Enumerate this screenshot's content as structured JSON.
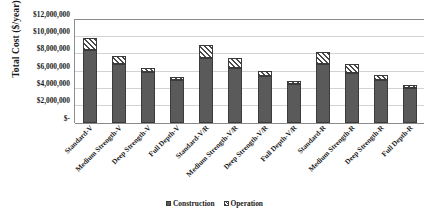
{
  "chart_data": {
    "type": "bar",
    "title": "",
    "subtitle": "",
    "xlabel": "",
    "ylabel": "Total Cost ($/year)",
    "ylim": [
      0,
      12000000
    ],
    "ytick_values": [
      12000000,
      10000000,
      8000000,
      6000000,
      4000000,
      2000000,
      0
    ],
    "ytick_labels": [
      "$12,000,000",
      "$10,000,000",
      "$8,000,000",
      "$6,000,000",
      "$4,000,000",
      "$2,000,000",
      "$-"
    ],
    "grid": true,
    "grid_axis": "y",
    "stacked": true,
    "legend_position": "bottom",
    "categories": [
      "Standard-V",
      "Medium Strength-V",
      "Deep Strength-V",
      "Full Depth-V",
      "Standard-V/R",
      "Medium Strength-V/R",
      "Deep Strength-V/R",
      "Full Depth-V/R",
      "Standard-R",
      "Medium Strength-R",
      "Deep Strength-R",
      "Full Depth-R"
    ],
    "series": [
      {
        "name": "Construction",
        "color": "#5a5a5a",
        "pattern": "solid",
        "values": [
          8400000,
          6800000,
          5800000,
          4900000,
          7500000,
          6300000,
          5400000,
          4500000,
          6800000,
          5750000,
          4900000,
          4000000
        ]
      },
      {
        "name": "Operation",
        "color": "#ffffff",
        "pattern": "diagonal-hatch",
        "values": [
          1400000,
          850000,
          500000,
          350000,
          1400000,
          1100000,
          600000,
          300000,
          1300000,
          950000,
          550000,
          300000
        ]
      }
    ],
    "totals": [
      9800000,
      7650000,
      6300000,
      5250000,
      8900000,
      7400000,
      6000000,
      4800000,
      8100000,
      6700000,
      5450000,
      4300000
    ]
  },
  "legend": {
    "items": [
      {
        "label": "Construction"
      },
      {
        "label": "Operation"
      }
    ]
  },
  "colors": {
    "construction": "#5a5a5a",
    "operation_hatch": "#4a4a4a",
    "gridline": "#d2d2d2",
    "axis": "#8a8a8a",
    "text": "#1a1a1a",
    "background": "#ffffff"
  }
}
